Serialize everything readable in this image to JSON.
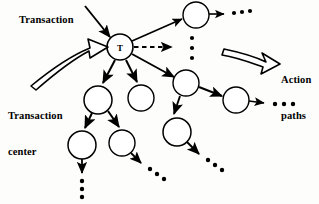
{
  "figure": {
    "type": "diagram",
    "subtype": "transaction-analysis-dfd",
    "background_color": "#fdfdfb",
    "stroke_color": "#000000",
    "node_fill": "#ffffff",
    "width": 319,
    "height": 204
  },
  "labels": {
    "transaction": "Transaction",
    "transaction_center": "Transaction\ncenter",
    "action_paths": "Action\npaths",
    "transaction_line1": "Transaction",
    "center_line1": "Transaction",
    "center_line2": "center",
    "action_line1": "Action",
    "action_line2": "paths"
  },
  "nodes": [
    {
      "id": "T",
      "label": "T",
      "cx": 120,
      "cy": 47,
      "r": 13
    },
    {
      "id": "n1",
      "label": "",
      "cx": 196,
      "cy": 15,
      "r": 13
    },
    {
      "id": "n2",
      "label": "",
      "cx": 186,
      "cy": 83,
      "r": 13
    },
    {
      "id": "n3",
      "label": "",
      "cx": 236,
      "cy": 100,
      "r": 13
    },
    {
      "id": "n4",
      "label": "",
      "cx": 98,
      "cy": 100,
      "r": 14
    },
    {
      "id": "n5",
      "label": "",
      "cx": 141,
      "cy": 98,
      "r": 13
    },
    {
      "id": "n6",
      "label": "",
      "cx": 177,
      "cy": 132,
      "r": 14
    },
    {
      "id": "n7",
      "label": "",
      "cx": 82,
      "cy": 145,
      "r": 14
    },
    {
      "id": "n8",
      "label": "",
      "cx": 122,
      "cy": 143,
      "r": 13
    }
  ],
  "edges": [
    {
      "from": "input",
      "to": "T",
      "style": "solid",
      "note": "incoming transaction arrow"
    },
    {
      "from": "T",
      "to": "n1",
      "style": "solid"
    },
    {
      "from": "T",
      "to": "dots-mid",
      "style": "dashed"
    },
    {
      "from": "T",
      "to": "n2",
      "style": "solid"
    },
    {
      "from": "T",
      "to": "n4",
      "style": "solid"
    },
    {
      "from": "T",
      "to": "n5",
      "style": "solid"
    },
    {
      "from": "n1",
      "to": "dots-tr",
      "style": "solid"
    },
    {
      "from": "n2",
      "to": "n3",
      "style": "solid"
    },
    {
      "from": "n3",
      "to": "dots-r",
      "style": "solid"
    },
    {
      "from": "n2",
      "to": "n6",
      "style": "solid"
    },
    {
      "from": "n6",
      "to": "dots-br",
      "style": "solid"
    },
    {
      "from": "n4",
      "to": "n7",
      "style": "solid"
    },
    {
      "from": "n4",
      "to": "n8",
      "style": "solid"
    },
    {
      "from": "n7",
      "to": "dots-b",
      "style": "solid"
    },
    {
      "from": "n8",
      "to": "dots-bd",
      "style": "solid"
    }
  ],
  "ellipses": [
    {
      "id": "dots-tr",
      "orientation": "horizontal",
      "count": 3
    },
    {
      "id": "dots-mid-h",
      "orientation": "horizontal",
      "count": 3
    },
    {
      "id": "dots-mid-v",
      "orientation": "vertical",
      "count": 3
    },
    {
      "id": "dots-r",
      "orientation": "horizontal",
      "count": 3
    },
    {
      "id": "dots-br",
      "orientation": "diagonal",
      "count": 3
    },
    {
      "id": "dots-b",
      "orientation": "vertical",
      "count": 3
    },
    {
      "id": "dots-bd",
      "orientation": "diagonal",
      "count": 3
    }
  ],
  "callouts": [
    {
      "id": "transaction-center-arrow",
      "label_ref": "transaction_center",
      "shape": "curved-block-arrow",
      "points_to": "T"
    },
    {
      "id": "action-paths-arrow",
      "label_ref": "action_paths",
      "shape": "curved-block-arrow",
      "points_to": "right"
    }
  ]
}
